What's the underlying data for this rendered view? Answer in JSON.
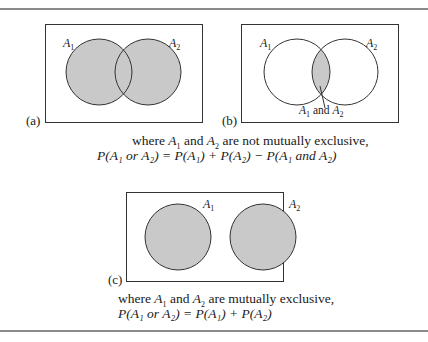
{
  "panels": {
    "a": {
      "label": "(a)",
      "set1": "A",
      "set2": "A",
      "sub1": "1",
      "sub2": "2"
    },
    "b": {
      "label": "(b)",
      "set1": "A",
      "set2": "A",
      "sub1": "1",
      "sub2": "2",
      "intersection_label": {
        "a": "A",
        "sub1": "1",
        "and": " and ",
        "b": "A",
        "sub2": "2"
      }
    },
    "c": {
      "label": "(c)",
      "set1": "A",
      "set2": "A",
      "sub1": "1",
      "sub2": "2"
    }
  },
  "caption_top": {
    "line1": {
      "pre": "where ",
      "A1": "A",
      "s1": "1",
      "mid": " and ",
      "A2": "A",
      "s2": "2",
      "post": " are not mutually exclusive,"
    },
    "line2": "P(A₁ or A₂) = P(A₁) + P(A₂) − P(A₁ and A₂)"
  },
  "caption_bottom": {
    "line1": {
      "pre": "where ",
      "A1": "A",
      "s1": "1",
      "mid": " and ",
      "A2": "A",
      "s2": "2",
      "post": " are mutually exclusive,"
    },
    "line2": "P(A₁ or A₂) = P(A₁) + P(A₂)"
  },
  "colors": {
    "shade": "#c9c9c9",
    "stroke": "#333333",
    "rule": "#8a8a8a"
  }
}
